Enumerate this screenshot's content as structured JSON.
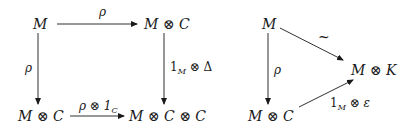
{
  "diagram_left": {
    "nodes": {
      "top_left": "M",
      "top_right": "M ⊗ C",
      "bottom_left": "M ⊗ C",
      "bottom_right": "M ⊗ C ⊗ C"
    },
    "arrows": {
      "top": "ρ",
      "left": "ρ",
      "right_main": "1",
      "right_sub": "M",
      "right_rest": " ⊗ Δ",
      "bottom_main": "ρ ⊗ 1",
      "bottom_sub": "C"
    }
  },
  "diagram_right": {
    "nodes": {
      "top": "M",
      "right": "M ⊗ K",
      "bottom": "M ⊗ C"
    },
    "arrows": {
      "diagonal_top": "~",
      "left": "ρ",
      "diagonal_bottom_main": "1",
      "diagonal_bottom_sub": "M",
      "diagonal_bottom_rest": " ⊗ ε"
    }
  },
  "colors": {
    "ink": "#1a1a1a",
    "background": "#ffffff"
  }
}
